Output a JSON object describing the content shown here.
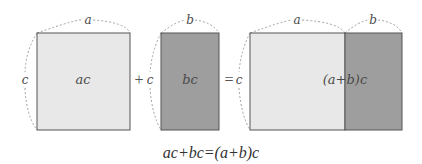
{
  "diagram": {
    "colors": {
      "light": "#e8e8e8",
      "dark": "#9e9e9e",
      "stroke": "#555555",
      "dash": "#8a8a8a"
    },
    "rect_ac": {
      "label": "ac",
      "width_label": "a",
      "height_label": "c"
    },
    "plus": "+",
    "rect_bc": {
      "label": "bc",
      "width_label": "b",
      "height_label": "c"
    },
    "equals": "=",
    "rect_combined": {
      "label": "(a+b)c",
      "width_labels": [
        "a",
        "b"
      ],
      "height_label": "c"
    },
    "equation": "ac+bc=(a+b)c"
  }
}
